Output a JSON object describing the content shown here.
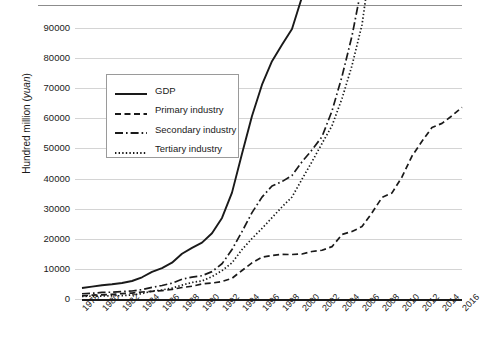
{
  "chart_data": {
    "type": "line",
    "title": "",
    "subtitle": "",
    "xlabel": "",
    "ylabel": "Hundred million (yuan)",
    "ylabel_plain": "Hundred million (",
    "ylabel_italic": "yuan",
    "ylabel_tail": ")",
    "xlim": [
      1978,
      2016
    ],
    "ylim": [
      0,
      90000
    ],
    "ytick_step": 10000,
    "grid": true,
    "legend_position": "upper-left-inside",
    "yticks": [
      "0",
      "10000",
      "20000",
      "30000",
      "40000",
      "50000",
      "60000",
      "70000",
      "80000",
      "90000"
    ],
    "ytick_values": [
      0,
      10000,
      20000,
      30000,
      40000,
      50000,
      60000,
      70000,
      80000,
      90000
    ],
    "xticks": [
      "1978",
      "1980",
      "1982",
      "1984",
      "1986",
      "1988",
      "1990",
      "1992",
      "1994",
      "1996",
      "1998",
      "2000",
      "2002",
      "2004",
      "2006",
      "2008",
      "2010",
      "2012",
      "2014",
      "2016"
    ],
    "xtick_values": [
      1978,
      1980,
      1982,
      1984,
      1986,
      1988,
      1990,
      1992,
      1994,
      1996,
      1998,
      2000,
      2002,
      2004,
      2006,
      2008,
      2010,
      2012,
      2014,
      2016
    ],
    "x": [
      1978,
      1979,
      1980,
      1981,
      1982,
      1983,
      1984,
      1985,
      1986,
      1987,
      1988,
      1989,
      1990,
      1991,
      1992,
      1993,
      1994,
      1995,
      1996,
      1997,
      1998,
      1999,
      2000,
      2001,
      2002,
      2003,
      2004,
      2005,
      2006,
      2007,
      2008,
      2009,
      2010,
      2011,
      2012,
      2013,
      2014,
      2015,
      2016
    ],
    "series": [
      {
        "name": "GDP",
        "style": "solid",
        "color": "#1a1a1a",
        "values": [
          3650,
          4100,
          4550,
          4890,
          5330,
          5980,
          7210,
          9020,
          10280,
          12060,
          15040,
          17000,
          18720,
          21830,
          26920,
          35330,
          48200,
          60790,
          71180,
          78970,
          84400,
          89680,
          100280,
          110860,
          121720,
          137420,
          161840,
          187320,
          219440,
          270090,
          319520,
          349080,
          413030,
          489300,
          540370,
          595240,
          643970,
          689050,
          743590
        ]
      },
      {
        "name": "Primary industry",
        "style": "dashed",
        "color": "#1a1a1a",
        "values": [
          1020,
          1260,
          1370,
          1560,
          1780,
          1980,
          2320,
          2540,
          2760,
          3200,
          3830,
          4230,
          5020,
          5290,
          5800,
          6880,
          9460,
          12020,
          13880,
          14440,
          14820,
          14770,
          14940,
          15780,
          16190,
          17380,
          21420,
          22420,
          24040,
          28630,
          33700,
          35230,
          40530,
          47480,
          52370,
          56960,
          58330,
          60860,
          63670
        ]
      },
      {
        "name": "Secondary industry",
        "style": "dashdot",
        "color": "#1a1a1a",
        "values": [
          1750,
          1910,
          2190,
          2260,
          2460,
          2650,
          3110,
          3870,
          4490,
          5250,
          6590,
          7280,
          7720,
          9100,
          11700,
          16430,
          22370,
          28680,
          33830,
          37540,
          39000,
          41030,
          45560,
          49510,
          53900,
          62440,
          73900,
          87360,
          104360,
          126630,
          149950,
          160170,
          191630,
          227040,
          244640,
          261950,
          277570,
          282040,
          296240
        ]
      },
      {
        "name": "Tertiary industry",
        "style": "dotted",
        "color": "#1a1a1a",
        "values": [
          880,
          930,
          990,
          1070,
          1090,
          1350,
          1780,
          2610,
          3030,
          3610,
          4620,
          5490,
          5980,
          7440,
          9420,
          12020,
          16400,
          20090,
          23430,
          27000,
          30580,
          33870,
          39800,
          45600,
          51650,
          57540,
          66570,
          77520,
          91030,
          114790,
          135820,
          153790,
          180970,
          214760,
          243570,
          276390,
          308140,
          346150,
          383730
        ]
      }
    ]
  }
}
